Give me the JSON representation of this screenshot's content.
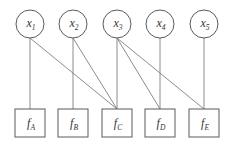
{
  "diagram": {
    "type": "factor-graph",
    "variables": [
      {
        "id": "x1",
        "base": "x",
        "sub": "1",
        "cx": 30,
        "cy": 24
      },
      {
        "id": "x2",
        "base": "x",
        "sub": "2",
        "cx": 73,
        "cy": 24
      },
      {
        "id": "x3",
        "base": "x",
        "sub": "3",
        "cx": 117,
        "cy": 24
      },
      {
        "id": "x4",
        "base": "x",
        "sub": "4",
        "cx": 160,
        "cy": 24
      },
      {
        "id": "x5",
        "base": "x",
        "sub": "5",
        "cx": 204,
        "cy": 24
      }
    ],
    "factors": [
      {
        "id": "fA",
        "base": "f",
        "sub": "A",
        "cx": 30,
        "top": 109
      },
      {
        "id": "fB",
        "base": "f",
        "sub": "B",
        "cx": 73,
        "top": 109
      },
      {
        "id": "fC",
        "base": "f",
        "sub": "C",
        "cx": 117,
        "top": 109
      },
      {
        "id": "fD",
        "base": "f",
        "sub": "D",
        "cx": 160,
        "top": 109
      },
      {
        "id": "fE",
        "base": "f",
        "sub": "E",
        "cx": 204,
        "top": 109
      }
    ],
    "edges": [
      [
        "x1",
        "fA"
      ],
      [
        "x1",
        "fC"
      ],
      [
        "x2",
        "fB"
      ],
      [
        "x2",
        "fC"
      ],
      [
        "x3",
        "fC"
      ],
      [
        "x3",
        "fD"
      ],
      [
        "x3",
        "fE"
      ],
      [
        "x4",
        "fD"
      ],
      [
        "x5",
        "fE"
      ]
    ],
    "style": {
      "node_radius": 14,
      "factor_width": 30,
      "factor_height": 28,
      "stroke": "#5a5a5a",
      "edge_color": "#6e6e6e"
    }
  }
}
